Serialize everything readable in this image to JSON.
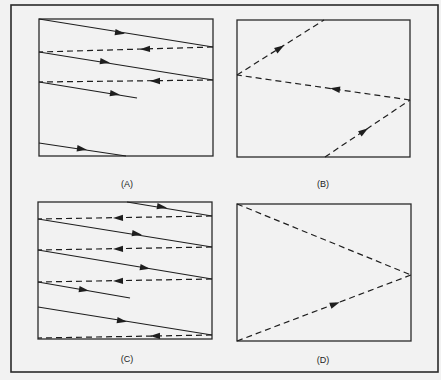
{
  "figure": {
    "outer_frame": {
      "x": 11,
      "y": 5,
      "w": 427,
      "h": 367
    },
    "line_color": "#1e1e1e",
    "frame_color": "#2a2a2a",
    "panels": [
      {
        "id": "A",
        "caption": "(A)",
        "caption_pos": [
          127,
          185
        ],
        "rect": [
          39,
          19,
          174,
          137
        ],
        "paths": [
          {
            "style": "solid",
            "from": [
              39,
              19
            ],
            "to": [
              213,
              47
            ],
            "arrow": [
              120,
              33
            ]
          },
          {
            "style": "dashed",
            "from": [
              213,
              47
            ],
            "to": [
              39,
              52
            ],
            "arrow": [
              145,
              49
            ]
          },
          {
            "style": "solid",
            "from": [
              39,
              52
            ],
            "to": [
              213,
              80
            ],
            "arrow": [
              105,
              62
            ]
          },
          {
            "style": "dashed",
            "from": [
              213,
              80
            ],
            "to": [
              39,
              82
            ],
            "arrow": [
              155,
              81
            ]
          },
          {
            "style": "solid",
            "from": [
              39,
              82
            ],
            "to": [
              137,
              98
            ],
            "arrow": [
              115,
              94
            ]
          },
          {
            "style": "solid",
            "from": [
              39,
              143
            ],
            "to": [
              126,
              156
            ],
            "arrow": [
              82,
              149
            ]
          }
        ]
      },
      {
        "id": "B",
        "caption": "(B)",
        "caption_pos": [
          323,
          185
        ],
        "rect": [
          237,
          20,
          173,
          137
        ],
        "paths": [
          {
            "style": "dashed",
            "from": [
              237,
              75
            ],
            "to": [
              324,
              20
            ],
            "arrow": [
              280,
              48
            ]
          },
          {
            "style": "dashed",
            "from": [
              410,
              100
            ],
            "to": [
              237,
              75
            ],
            "arrow": [
              335,
              89
            ]
          },
          {
            "style": "dashed",
            "from": [
              325,
              157
            ],
            "to": [
              410,
              100
            ],
            "arrow": [
              364,
              131
            ]
          }
        ]
      },
      {
        "id": "C",
        "caption": "(C)",
        "caption_pos": [
          127,
          360
        ],
        "rect": [
          38,
          202,
          174,
          137
        ],
        "paths": [
          {
            "style": "solid",
            "from": [
              127,
              202
            ],
            "to": [
              212,
              216
            ],
            "arrow": [
              162,
              207
            ]
          },
          {
            "style": "dashed",
            "from": [
              212,
              216
            ],
            "to": [
              38,
              219
            ],
            "arrow": [
              118,
              218
            ]
          },
          {
            "style": "solid",
            "from": [
              38,
              219
            ],
            "to": [
              212,
              247
            ],
            "arrow": [
              137,
              234
            ]
          },
          {
            "style": "dashed",
            "from": [
              212,
              247
            ],
            "to": [
              38,
              250
            ],
            "arrow": [
              118,
              249
            ]
          },
          {
            "style": "solid",
            "from": [
              38,
              250
            ],
            "to": [
              212,
              279
            ],
            "arrow": [
              145,
              268
            ]
          },
          {
            "style": "dashed",
            "from": [
              212,
              279
            ],
            "to": [
              38,
              282
            ],
            "arrow": [
              118,
              281
            ]
          },
          {
            "style": "solid",
            "from": [
              38,
              282
            ],
            "to": [
              130,
              298
            ],
            "arrow": [
              84,
              290
            ]
          },
          {
            "style": "solid",
            "from": [
              38,
              307
            ],
            "to": [
              212,
              335
            ],
            "arrow": [
              122,
              321
            ]
          },
          {
            "style": "dashed",
            "from": [
              212,
              335
            ],
            "to": [
              38,
              338
            ],
            "arrow": [
              155,
              336
            ]
          }
        ]
      },
      {
        "id": "D",
        "caption": "(D)",
        "caption_pos": [
          323,
          361
        ],
        "rect": [
          237,
          204,
          174,
          137
        ],
        "paths": [
          {
            "style": "dashed",
            "from": [
              237,
              204
            ],
            "to": [
              411,
              275
            ],
            "arrow": null
          },
          {
            "style": "dashed",
            "from": [
              237,
              341
            ],
            "to": [
              411,
              275
            ],
            "arrow": [
              335,
              304
            ]
          }
        ]
      }
    ]
  }
}
